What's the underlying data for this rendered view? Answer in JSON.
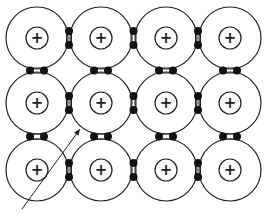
{
  "diagram": {
    "title": "Lattice of positive ions with shared electron pairs",
    "type": "covalent-lattice",
    "colors": {
      "stroke": "#222222",
      "dot": "#111111",
      "background": "#ffffff"
    },
    "grid": {
      "rows": 3,
      "cols": 4
    },
    "atoms": {
      "outer_radius": 31,
      "inner_radius": 11,
      "inner_symbol": "+",
      "centers_x": [
        37,
        101,
        166,
        230
      ],
      "centers_y": [
        38,
        103,
        170
      ]
    },
    "bonds": {
      "description": "electron pair between adjacent atoms",
      "dot_radius": 4,
      "dot_gap": 14
    },
    "arrow": {
      "from": [
        22,
        209
      ],
      "to": [
        80,
        129
      ],
      "label": ""
    }
  }
}
